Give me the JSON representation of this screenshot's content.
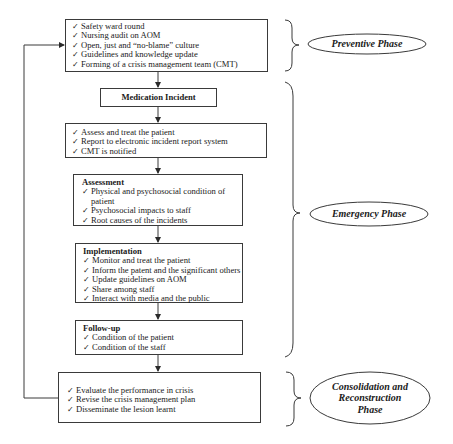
{
  "diagram": {
    "check_glyph": "✓",
    "boxes": {
      "preventive": {
        "items": [
          "Safety ward round",
          "Nursing audit on AOM",
          "Open, just and “no-blame” culture",
          "Guidelines and knowledge update",
          "Forming of a crisis management team  (CMT)"
        ]
      },
      "incident": {
        "title": "Medication Incident"
      },
      "initial_response": {
        "items": [
          "Assess and treat the patient",
          "Report to electronic  incident report system",
          "CMT is notified"
        ]
      },
      "assessment": {
        "title": "Assessment",
        "items": [
          "Physical and psychosocial condition of patient",
          "Psychosocial impacts to staff",
          "Root causes  of the incidents"
        ]
      },
      "implementation": {
        "title": "Implementation",
        "items": [
          "Monitor and treat the patient",
          "Inform the patent and the significant  others",
          "Update guidelines  on AOM",
          "Share among  staff",
          "Interact with media and the public"
        ]
      },
      "follow_up": {
        "title": "Follow-up",
        "items": [
          "Condition of the patient",
          "Condition of the staff"
        ]
      },
      "consolidation": {
        "items": [
          "Evaluate the performance in crisis",
          "Revise the crisis management  plan",
          "Disseminate the lesion learnt"
        ]
      }
    },
    "phases": {
      "preventive": "Preventive Phase",
      "emergency": "Emergency Phase",
      "consolidation_line1": "Consolidation and",
      "consolidation_line2": "Reconstruction",
      "consolidation_line3": "Phase"
    },
    "colors": {
      "line": "#3a3a3a",
      "text": "#1a1a1a",
      "background": "#ffffff"
    }
  }
}
